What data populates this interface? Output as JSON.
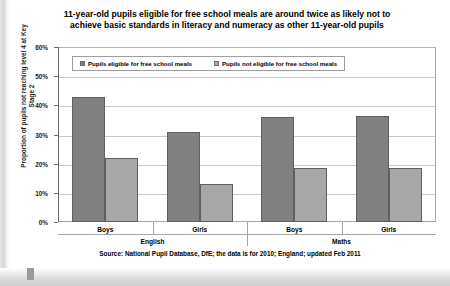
{
  "chart_data": {
    "type": "bar",
    "title": "11-year-old pupils eligible for free school meals are around twice as likely not to achieve basic standards in literacy and numeracy as other 11-year-old pupils",
    "xlabel": "",
    "ylabel": "Proportion of pupils not reaching level 4 at Key Stage 2",
    "ylim": [
      0,
      60
    ],
    "ytick_labels": [
      "60%",
      "50%",
      "40%",
      "30%",
      "20%",
      "10%",
      "0%"
    ],
    "ytick_values": [
      60,
      50,
      40,
      30,
      20,
      10,
      0
    ],
    "grid": true,
    "legend_position": "top-left-inside",
    "groups": [
      "English",
      "Maths"
    ],
    "categories": [
      "Boys",
      "Girls",
      "Boys",
      "Girls"
    ],
    "category_groups": [
      "English",
      "English",
      "Maths",
      "Maths"
    ],
    "series": [
      {
        "name": "Pupils eligible for free school meals",
        "color": "#808080",
        "values": [
          43.0,
          31.0,
          36.0,
          36.5
        ]
      },
      {
        "name": "Pupils not eligible for free school meals",
        "color": "#a8a8a8",
        "values": [
          22.0,
          13.0,
          18.5,
          18.5
        ]
      }
    ],
    "source": "Source: National Pupil Database, DfE; the data is for 2010; England; updated Feb 2011"
  },
  "icons": {
    "legend_marker": "square-swatch-icon"
  }
}
